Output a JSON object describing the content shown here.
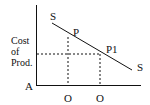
{
  "diagram": {
    "type": "supply-curve-diagram",
    "colors": {
      "line": "#111111",
      "background": "#ffffff"
    },
    "y_axis": {
      "label_lines": [
        "Cost",
        "of",
        "Prod."
      ]
    },
    "origin_label": "A",
    "x_axis": {
      "tick_labels": [
        "O",
        "O"
      ]
    },
    "curve": {
      "name": "S",
      "start_label": "S",
      "end_label": "S",
      "style": "solid",
      "direction": "downward-sloping"
    },
    "points": [
      {
        "label": "P"
      },
      {
        "label": "P1"
      }
    ],
    "guides": {
      "style": "dashed",
      "description": "Dashed lines from P and P1 down to x-axis; dashed horizontal from P1 level to y-axis"
    }
  }
}
